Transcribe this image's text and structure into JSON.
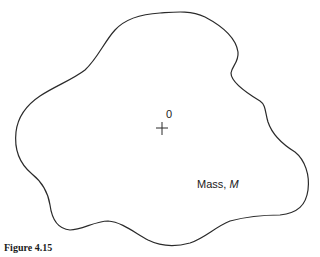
{
  "figure": {
    "caption": "Figure 4.15",
    "origin_label": "0",
    "mass_label_prefix": "Mass, ",
    "mass_label_symbol": "M",
    "stroke_color": "#2a2a2a",
    "background_color": "#ffffff"
  }
}
